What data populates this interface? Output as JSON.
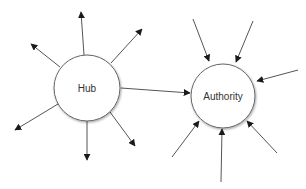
{
  "diagram": {
    "colors": {
      "stroke": "#555555",
      "arrow": "#1a1a1a",
      "node_fill": "#ffffff",
      "node_stroke": "#666666",
      "label": "#333333"
    },
    "nodes": {
      "hub": {
        "label": "Hub",
        "cx": 87,
        "cy": 88,
        "r": 33
      },
      "authority": {
        "label": "Authority",
        "cx": 223,
        "cy": 96,
        "r": 32
      }
    },
    "hub_outgoing_edges": [
      {
        "x1": 84,
        "y1": 55,
        "x2": 81,
        "y2": 12
      },
      {
        "x1": 60,
        "y1": 67,
        "x2": 31,
        "y2": 44
      },
      {
        "x1": 111,
        "y1": 63,
        "x2": 142,
        "y2": 29
      },
      {
        "x1": 58,
        "y1": 104,
        "x2": 15,
        "y2": 130
      },
      {
        "x1": 87,
        "y1": 121,
        "x2": 87,
        "y2": 160
      },
      {
        "x1": 110,
        "y1": 112,
        "x2": 135,
        "y2": 146
      }
    ],
    "hub_to_authority_edge": {
      "x1": 121,
      "y1": 88,
      "x2": 190,
      "y2": 93
    },
    "authority_incoming_edges": [
      {
        "x1": 193,
        "y1": 19,
        "x2": 209,
        "y2": 61
      },
      {
        "x1": 253,
        "y1": 21,
        "x2": 236,
        "y2": 62
      },
      {
        "x1": 298,
        "y1": 70,
        "x2": 257,
        "y2": 81
      },
      {
        "x1": 172,
        "y1": 157,
        "x2": 199,
        "y2": 121
      },
      {
        "x1": 221,
        "y1": 182,
        "x2": 222,
        "y2": 129
      },
      {
        "x1": 277,
        "y1": 153,
        "x2": 247,
        "y2": 121
      }
    ]
  }
}
